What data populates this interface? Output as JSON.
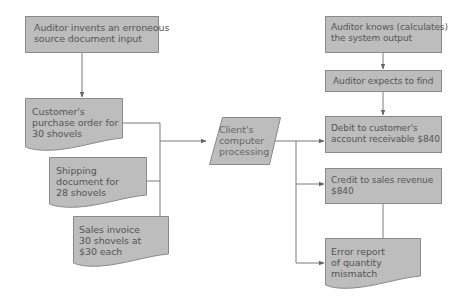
{
  "colors": {
    "box_fill": "#bdbdbd",
    "box_stroke": "#8a8a8a",
    "line": "#777777",
    "text": "#555555"
  },
  "nodes": {
    "invent": {
      "label": "Auditor invents an erroneous source document input",
      "lines": [
        "Auditor invents an erroneous",
        "source document input"
      ],
      "shape": "rectangle"
    },
    "purchase_order": {
      "label": "Customer's purchase order for 30 shovels",
      "lines": [
        "Customer's",
        "purchase order for",
        "30 shovels"
      ],
      "shape": "document"
    },
    "shipping": {
      "label": "Shipping document for 28 shovels",
      "lines": [
        "Shipping",
        "document for",
        "28 shovels"
      ],
      "shape": "document"
    },
    "invoice": {
      "label": "Sales invoice 30 shovels at $30 each",
      "lines": [
        "Sales invoice",
        "30 shovels at",
        "$30 each"
      ],
      "shape": "document"
    },
    "processing": {
      "label": "Client's computer processing",
      "lines": [
        "Client's",
        "computer",
        "processing"
      ],
      "shape": "parallelogram"
    },
    "knows": {
      "label": "Auditor knows (calculates) the system output",
      "lines": [
        "Auditor knows (calculates)",
        "the system output"
      ],
      "shape": "rectangle"
    },
    "expects": {
      "label": "Auditor expects to find",
      "lines": [
        "Auditor expects to find"
      ],
      "shape": "rectangle"
    },
    "debit": {
      "label": "Debit to customer's account receivable $840",
      "lines": [
        "Debit to customer's",
        "account receivable $840"
      ],
      "shape": "rectangle"
    },
    "credit": {
      "label": "Credit to sales revenue $840",
      "lines": [
        "Credit to sales revenue",
        "$840"
      ],
      "shape": "rectangle"
    },
    "error": {
      "label": "Error report of quantity mismatch",
      "lines": [
        "Error report",
        "of quantity",
        "mismatch"
      ],
      "shape": "document"
    }
  },
  "edges": [
    {
      "from": "invent",
      "to": "purchase_order"
    },
    {
      "from": "purchase_order",
      "to": "processing"
    },
    {
      "from": "shipping",
      "to": "processing"
    },
    {
      "from": "invoice",
      "to": "processing"
    },
    {
      "from": "processing",
      "to": "debit"
    },
    {
      "from": "processing",
      "to": "credit"
    },
    {
      "from": "processing",
      "to": "error"
    },
    {
      "from": "knows",
      "to": "expects"
    },
    {
      "from": "expects",
      "to": "debit"
    },
    {
      "from": "credit",
      "to": "error",
      "arrow": false
    }
  ]
}
